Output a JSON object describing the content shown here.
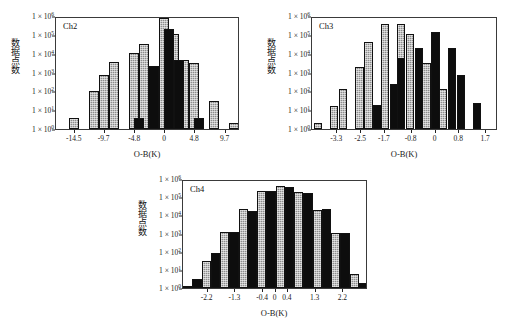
{
  "figure": {
    "background": "#ffffff",
    "axis_color": "#3a3a3a",
    "gray_bar_color": "#8d8d8d",
    "black_bar_color": "#0d0d0d"
  },
  "common": {
    "ylabel": "数据点数",
    "xlabel": "O-B(K)",
    "y_ticks": [
      "1 × 10",
      "1 × 10",
      "1 × 10",
      "1 × 10",
      "1 × 10",
      "1 × 10",
      "1 × 10"
    ],
    "y_exponents": [
      "6",
      "5",
      "4",
      "3",
      "2",
      "1",
      "0"
    ]
  },
  "chart_data": [
    {
      "type": "bar",
      "title": "Ch2",
      "xlabel": "O-B(K)",
      "ylabel": "数据点数",
      "yscale": "log",
      "ylim": [
        1,
        1000000
      ],
      "ytick_labels": [
        "1 × 10⁶",
        "1 × 10⁵",
        "1 × 10⁴",
        "1 × 10³",
        "1 × 10²",
        "1 × 10¹",
        "1 × 10⁰"
      ],
      "xtick_labels": [
        "-14.5",
        "-9.7",
        "-4.8",
        "0",
        "4.8",
        "9.7"
      ],
      "xtick_values": [
        -14.5,
        -9.7,
        -4.8,
        0,
        4.8,
        9.7
      ],
      "xlim": [
        -17.5,
        12.0
      ],
      "grid": false,
      "legend": "none",
      "bin_width": 1.6,
      "series": [
        {
          "name": "gray",
          "color": "#8d8d8d",
          "bins": [
            {
              "center": -14.6,
              "value": 4
            },
            {
              "center": -11.4,
              "value": 100
            },
            {
              "center": -9.8,
              "value": 750
            },
            {
              "center": -8.2,
              "value": 3700
            },
            {
              "center": -5.0,
              "value": 11000
            },
            {
              "center": -3.4,
              "value": 31000
            },
            {
              "center": -0.2,
              "value": 800000
            },
            {
              "center": 1.4,
              "value": 110000
            },
            {
              "center": 3.0,
              "value": 4700
            },
            {
              "center": 4.6,
              "value": 3300
            },
            {
              "center": 7.8,
              "value": 30
            },
            {
              "center": 11.0,
              "value": 2
            }
          ]
        },
        {
          "name": "black",
          "color": "#0d0d0d",
          "bins": [
            {
              "center": -4.2,
              "value": 4
            },
            {
              "center": -1.8,
              "value": 2200
            },
            {
              "center": 0.6,
              "value": 210000
            },
            {
              "center": 2.2,
              "value": 4700
            },
            {
              "center": 5.4,
              "value": 4
            }
          ]
        }
      ]
    },
    {
      "type": "bar",
      "title": "Ch3",
      "xlabel": "O-B(K)",
      "ylabel": "数据点数",
      "yscale": "log",
      "ylim": [
        1,
        1000000
      ],
      "ytick_labels": [
        "1 × 10⁶",
        "1 × 10⁵",
        "1 × 10⁴",
        "1 × 10³",
        "1 × 10²",
        "1 × 10¹",
        "1 × 10⁰"
      ],
      "xtick_labels": [
        "-3.3",
        "-2.5",
        "-1.7",
        "-0.8",
        "0",
        "0.8",
        "1.7"
      ],
      "xtick_values": [
        -3.3,
        -2.5,
        -1.7,
        -0.8,
        0,
        0.8,
        1.7
      ],
      "xlim": [
        -4.15,
        2.1
      ],
      "grid": false,
      "legend": "none",
      "bin_width": 0.28,
      "series": [
        {
          "name": "gray",
          "color": "#8d8d8d",
          "bins": [
            {
              "center": -3.95,
              "value": 2
            },
            {
              "center": -3.4,
              "value": 17
            },
            {
              "center": -3.1,
              "value": 140
            },
            {
              "center": -2.55,
              "value": 2000
            },
            {
              "center": -2.25,
              "value": 40000
            },
            {
              "center": -1.7,
              "value": 370000
            },
            {
              "center": -1.15,
              "value": 400000
            },
            {
              "center": -0.85,
              "value": 110000
            },
            {
              "center": -0.3,
              "value": 3200
            },
            {
              "center": 0.25,
              "value": 130
            },
            {
              "center": 0.55,
              "value": 21000
            },
            {
              "center": 0.85,
              "value": 10
            }
          ]
        },
        {
          "name": "black",
          "color": "#0d0d0d",
          "bins": [
            {
              "center": -1.95,
              "value": 19
            },
            {
              "center": -1.4,
              "value": 250
            },
            {
              "center": -1.15,
              "value": 5800
            },
            {
              "center": -0.55,
              "value": 20000
            },
            {
              "center": 0.0,
              "value": 150000
            },
            {
              "center": 0.55,
              "value": 20000
            },
            {
              "center": 0.85,
              "value": 700
            },
            {
              "center": 1.4,
              "value": 25
            }
          ]
        }
      ]
    },
    {
      "type": "bar",
      "title": "Ch4",
      "xlabel": "O-B(K)",
      "ylabel": "数据点数",
      "yscale": "log",
      "ylim": [
        1,
        1000000
      ],
      "ytick_labels": [
        "1 × 10⁶",
        "1 × 10⁵",
        "1 × 10⁴",
        "1 × 10³",
        "1 × 10²",
        "1 × 10¹",
        "1 × 10⁰"
      ],
      "xtick_labels": [
        "-2.2",
        "-1.3",
        "-0.4",
        "0",
        "0.4",
        "1.3",
        "2.2"
      ],
      "xtick_values": [
        -2.2,
        -1.3,
        -0.4,
        0,
        0.4,
        1.3,
        2.2
      ],
      "xlim": [
        -3.0,
        3.0
      ],
      "grid": false,
      "legend": "none",
      "bin_width": 0.3,
      "series": [
        {
          "name": "gray",
          "color": "#8d8d8d",
          "bins": [
            {
              "center": -2.85,
              "value": 1
            },
            {
              "center": -2.25,
              "value": 30
            },
            {
              "center": -1.65,
              "value": 1200
            },
            {
              "center": -1.05,
              "value": 22000
            },
            {
              "center": -0.45,
              "value": 230000
            },
            {
              "center": 0.15,
              "value": 420000
            },
            {
              "center": 0.75,
              "value": 190000
            },
            {
              "center": 1.35,
              "value": 20000
            },
            {
              "center": 1.95,
              "value": 1100
            },
            {
              "center": 2.55,
              "value": 6
            }
          ]
        },
        {
          "name": "black",
          "color": "#0d0d0d",
          "bins": [
            {
              "center": -2.55,
              "value": 3
            },
            {
              "center": -1.95,
              "value": 90
            },
            {
              "center": -1.35,
              "value": 1150
            },
            {
              "center": -0.75,
              "value": 17000
            },
            {
              "center": -0.15,
              "value": 210000
            },
            {
              "center": 0.45,
              "value": 370000
            },
            {
              "center": 1.05,
              "value": 180000
            },
            {
              "center": 1.65,
              "value": 22000
            },
            {
              "center": 2.25,
              "value": 1100
            },
            {
              "center": 2.85,
              "value": 2
            }
          ]
        }
      ]
    }
  ]
}
